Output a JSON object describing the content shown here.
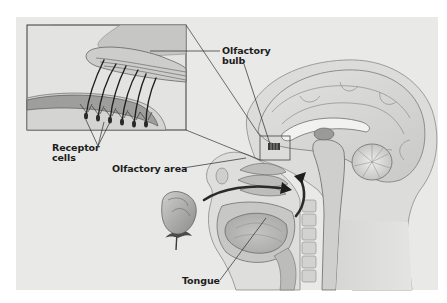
{
  "figure": {
    "colors": {
      "background": "#ffffff",
      "panel": "#e9e9e8",
      "ink": "#1c1c1c",
      "tissue_light": "#d8d8d6",
      "tissue_mid": "#b4b4b2",
      "tissue_dark": "#6e6e6c"
    },
    "labels": {
      "olfactory_bulb": "Olfactory bulb",
      "olfactory_bulb_line1": "Olfactory",
      "olfactory_bulb_line2": "bulb",
      "receptor_cells_line1": "Receptor",
      "receptor_cells_line2": "cells",
      "olfactory_area": "Olfactory area",
      "tongue": "Tongue"
    },
    "parts": [
      "magnified-inset",
      "olfactory-bulb",
      "receptor-cells",
      "olfactory-area",
      "nasal-cavity",
      "airflow-arrows",
      "brain",
      "cerebellum",
      "spinal-column",
      "tongue",
      "rose"
    ]
  }
}
